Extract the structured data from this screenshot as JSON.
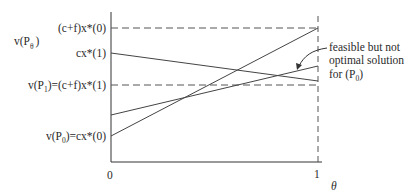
{
  "diagram": {
    "y_axis_label": "v(P",
    "y_axis_label_sub": "θ",
    "y_axis_label_close": ")",
    "x_axis_label": "θ",
    "x_ticks": [
      "0",
      "1"
    ],
    "y_labels": {
      "top": "(c+f)x*(0)",
      "cx1": "cx*(1)",
      "vp1_prefix": "v(P",
      "vp1_sub": "1",
      "vp1_suffix": ")=(c+f)x*(1)",
      "vp0_prefix": "v(P",
      "vp0_sub": "0",
      "vp0_suffix": ")=cx*(0)"
    },
    "annotation": {
      "line1": "feasible but not",
      "line2": "optimal solution",
      "line3_prefix": "for (P",
      "line3_sub": "0",
      "line3_suffix": ")"
    },
    "colors": {
      "ink": "#2a2a2a",
      "dash": "#555555"
    }
  }
}
